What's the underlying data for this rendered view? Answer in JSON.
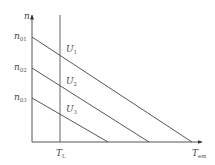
{
  "diagram": {
    "type": "mechanical characteristic (n vs T_em) of DC motor at different armature voltages",
    "axes": {
      "y": {
        "label": "n",
        "sub": ""
      },
      "x": {
        "label": "T",
        "sub": "em"
      }
    },
    "load_torque": {
      "label": "T",
      "sub": "L",
      "x": 60
    },
    "origin": {
      "x": 32,
      "y": 142
    },
    "y_axis_top": 15,
    "x_axis_right": 202,
    "lines": [
      {
        "name": "U1",
        "label": "U",
        "sub": "1",
        "start_label": "n",
        "start_sub": "01",
        "x1": 32,
        "y1": 37,
        "x2": 192,
        "y2": 142,
        "label_x": 66,
        "label_y": 52
      },
      {
        "name": "U2",
        "label": "U",
        "sub": "2",
        "start_label": "n",
        "start_sub": "02",
        "x1": 32,
        "y1": 68,
        "x2": 149,
        "y2": 142,
        "label_x": 66,
        "label_y": 84
      },
      {
        "name": "U3",
        "label": "U",
        "sub": "3",
        "start_label": "n",
        "start_sub": "03",
        "x1": 32,
        "y1": 98,
        "x2": 108,
        "y2": 142,
        "label_x": 66,
        "label_y": 112
      }
    ]
  }
}
